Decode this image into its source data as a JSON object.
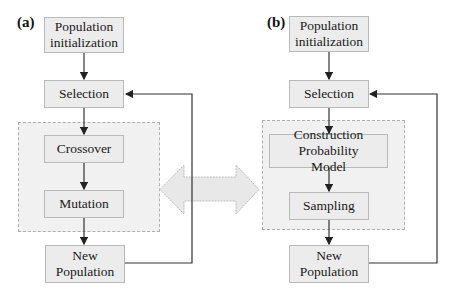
{
  "panels": {
    "a": {
      "label": "(a)",
      "nodes": {
        "init": "Population initialization",
        "selection": "Selection",
        "crossover": "Crossover",
        "mutation": "Mutation",
        "new_population": "New Population"
      }
    },
    "b": {
      "label": "(b)",
      "nodes": {
        "init": "Population initialization",
        "selection": "Selection",
        "construction": "Construction Probability Model",
        "sampling": "Sampling",
        "new_population": "New Population"
      }
    }
  },
  "connector": {
    "type": "double-headed-arrow",
    "color": "#e6e6e6"
  },
  "colors": {
    "box_fill": "#ececec",
    "box_border": "#b9b9b9",
    "region_fill": "#f1f1f1",
    "line": "#333333"
  }
}
